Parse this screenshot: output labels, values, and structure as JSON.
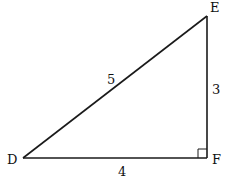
{
  "diagram": {
    "type": "right-triangle",
    "stroke_color": "#1a1a1a",
    "background": "#ffffff",
    "vertices": {
      "D": {
        "label": "D",
        "x": 23,
        "y": 158
      },
      "E": {
        "label": "E",
        "x": 207,
        "y": 16
      },
      "F": {
        "label": "F",
        "x": 207,
        "y": 158
      }
    },
    "sides": {
      "DE": {
        "label": "5"
      },
      "EF": {
        "label": "3"
      },
      "DF": {
        "label": "4"
      }
    },
    "right_angle_at": "F"
  }
}
